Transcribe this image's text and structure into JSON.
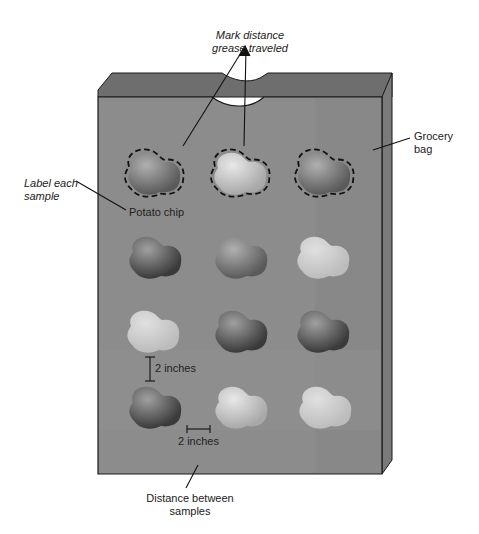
{
  "labels": {
    "mark_distance_line1": "Mark distance",
    "mark_distance_line2": "grease traveled",
    "label_each_line1": "Label each",
    "label_each_line2": "sample",
    "potato_chip": "Potato chip",
    "grocery_line1": "Grocery",
    "grocery_line2": "bag",
    "vertical_spacing": "2 inches",
    "horizontal_spacing": "2 inches",
    "distance_line1": "Distance between",
    "distance_line2": "samples"
  },
  "colors": {
    "bag_front": "#8c8c8c",
    "bag_back": "#6e6e6e",
    "bag_side": "#7a7a7a",
    "outline": "#1a1a1a"
  },
  "grid": {
    "rows": 4,
    "cols": 3,
    "samples": [
      {
        "row": 1,
        "col": 1,
        "shade": "#b5b5b5",
        "outlined": true
      },
      {
        "row": 1,
        "col": 2,
        "shade": "#c8c8c8",
        "outlined": true
      },
      {
        "row": 1,
        "col": 3,
        "shade": "#9a9a9a",
        "outlined": true
      },
      {
        "row": 2,
        "col": 1,
        "shade": "#707070",
        "outlined": false
      },
      {
        "row": 2,
        "col": 2,
        "shade": "#7a7a7a",
        "outlined": false
      },
      {
        "row": 2,
        "col": 3,
        "shade": "#d0d0d0",
        "outlined": false
      },
      {
        "row": 3,
        "col": 1,
        "shade": "#bdbdbd",
        "outlined": false
      },
      {
        "row": 3,
        "col": 2,
        "shade": "#5f5f5f",
        "outlined": false
      },
      {
        "row": 3,
        "col": 3,
        "shade": "#4e4e4e",
        "outlined": false
      },
      {
        "row": 4,
        "col": 1,
        "shade": "#6a6a6a",
        "outlined": false
      },
      {
        "row": 4,
        "col": 2,
        "shade": "#d2d2d2",
        "outlined": false
      },
      {
        "row": 4,
        "col": 3,
        "shade": "#c4c4c4",
        "outlined": false
      }
    ]
  }
}
